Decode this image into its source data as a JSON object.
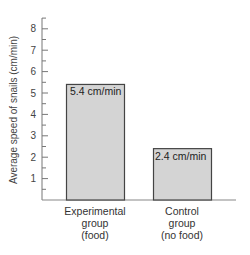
{
  "chart_data": {
    "type": "bar",
    "title": "",
    "xlabel": "",
    "ylabel": "Average speed of snails (cm/min)",
    "ylim": [
      0,
      8.5
    ],
    "yticks": [
      "1",
      "2",
      "3",
      "4",
      "5",
      "6",
      "7",
      "8"
    ],
    "categories": [
      {
        "line1": "Experimental",
        "line2": "group",
        "line3": "(food)"
      },
      {
        "line1": "Control",
        "line2": "group",
        "line3": "(no food)"
      }
    ],
    "values": [
      5.4,
      2.4
    ],
    "data_labels": [
      "5.4 cm/min",
      "2.4 cm/min"
    ],
    "grid": false,
    "legend": "none",
    "bar_color": "#d4d4d4",
    "bar_border_color": "#444444"
  }
}
